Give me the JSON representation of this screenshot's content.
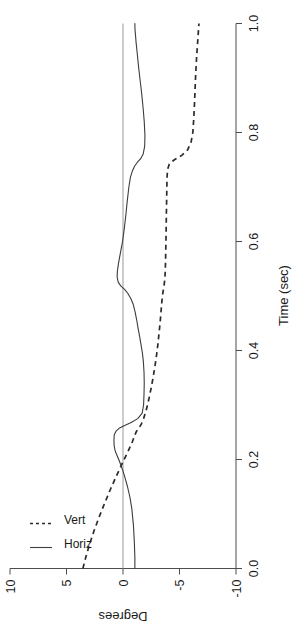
{
  "chart_data": {
    "type": "line",
    "title": "",
    "subtitle": "",
    "xlabel": "Time (sec)",
    "ylabel": "Degrees",
    "xlim": [
      0.0,
      1.0
    ],
    "ylim": [
      -10,
      10
    ],
    "grid": false,
    "orientation": "rotated-90-ccw",
    "legend_position": "top-left",
    "xticks": [
      "0.0",
      "0.2",
      "0.4",
      "0.6",
      "0.8",
      "1.0"
    ],
    "xtick_values": [
      0.0,
      0.2,
      0.4,
      0.6,
      0.8,
      1.0
    ],
    "yticks": [
      "10",
      "5",
      "0",
      "-5",
      "-10"
    ],
    "ytick_values": [
      10,
      5,
      0,
      -5,
      -10
    ],
    "zero_reference_line": 0,
    "series": [
      {
        "name": "Horiz",
        "style": "solid",
        "color": "#3c3c3c",
        "x": [
          0.0,
          0.02,
          0.05,
          0.08,
          0.11,
          0.13,
          0.15,
          0.165,
          0.18,
          0.195,
          0.205,
          0.212,
          0.218,
          0.225,
          0.235,
          0.245,
          0.252,
          0.258,
          0.262,
          0.268,
          0.275,
          0.285,
          0.3,
          0.32,
          0.34,
          0.36,
          0.38,
          0.395,
          0.41,
          0.425,
          0.44,
          0.455,
          0.47,
          0.485,
          0.495,
          0.505,
          0.512,
          0.518,
          0.525,
          0.535,
          0.545,
          0.56,
          0.58,
          0.6,
          0.625,
          0.65,
          0.675,
          0.7,
          0.718,
          0.73,
          0.738,
          0.745,
          0.752,
          0.76,
          0.775,
          0.795,
          0.82,
          0.845,
          0.87,
          0.895,
          0.92,
          0.945,
          0.965,
          0.98,
          0.99,
          1.0
        ],
        "values": [
          -1.05,
          -1.05,
          -1.0,
          -0.92,
          -0.78,
          -0.62,
          -0.4,
          -0.2,
          0.02,
          0.28,
          0.48,
          0.62,
          0.72,
          0.78,
          0.8,
          0.78,
          0.62,
          0.3,
          -0.1,
          -0.72,
          -1.3,
          -1.7,
          -1.82,
          -1.86,
          -1.88,
          -1.86,
          -1.8,
          -1.72,
          -1.6,
          -1.48,
          -1.34,
          -1.22,
          -1.08,
          -0.9,
          -0.7,
          -0.42,
          -0.14,
          0.18,
          0.42,
          0.52,
          0.5,
          0.4,
          0.22,
          0.04,
          -0.12,
          -0.26,
          -0.38,
          -0.52,
          -0.66,
          -0.84,
          -1.02,
          -1.26,
          -1.56,
          -1.78,
          -1.92,
          -1.94,
          -1.88,
          -1.78,
          -1.66,
          -1.52,
          -1.38,
          -1.26,
          -1.16,
          -1.1,
          -1.06,
          -1.05
        ]
      },
      {
        "name": "Vert",
        "style": "dashed",
        "color": "#2b2b2b",
        "x": [
          0.0,
          0.02,
          0.045,
          0.07,
          0.095,
          0.12,
          0.145,
          0.17,
          0.195,
          0.215,
          0.232,
          0.245,
          0.252,
          0.258,
          0.265,
          0.275,
          0.29,
          0.31,
          0.33,
          0.35,
          0.37,
          0.39,
          0.41,
          0.43,
          0.45,
          0.47,
          0.49,
          0.505,
          0.518,
          0.53,
          0.545,
          0.56,
          0.58,
          0.6,
          0.625,
          0.65,
          0.675,
          0.7,
          0.718,
          0.732,
          0.742,
          0.75,
          0.758,
          0.768,
          0.782,
          0.8,
          0.825,
          0.85,
          0.88,
          0.91,
          0.94,
          0.97,
          1.0
        ],
        "values": [
          3.55,
          3.3,
          2.95,
          2.55,
          2.1,
          1.62,
          1.12,
          0.58,
          0.02,
          -0.45,
          -0.82,
          -1.05,
          -1.2,
          -1.42,
          -1.62,
          -1.82,
          -2.05,
          -2.28,
          -2.48,
          -2.66,
          -2.82,
          -2.96,
          -3.08,
          -3.18,
          -3.28,
          -3.36,
          -3.44,
          -3.52,
          -3.62,
          -3.7,
          -3.74,
          -3.76,
          -3.78,
          -3.8,
          -3.82,
          -3.84,
          -3.86,
          -3.88,
          -3.9,
          -3.94,
          -4.1,
          -4.55,
          -5.2,
          -5.72,
          -6.02,
          -6.18,
          -6.26,
          -6.32,
          -6.38,
          -6.44,
          -6.52,
          -6.62,
          -6.72
        ]
      }
    ],
    "legend": [
      {
        "label": "Horiz",
        "style": "solid"
      },
      {
        "label": "Vert",
        "style": "dashed"
      }
    ]
  },
  "axes": {
    "x_title": "Time (sec)",
    "y_title": "Degrees"
  },
  "colors": {
    "background": "#ffffff",
    "axis": "#4d4d4d",
    "zero_line": "#9a9a9a",
    "horiz_series": "#3c3c3c",
    "vert_series": "#2b2b2b",
    "text": "#1a1a1a"
  }
}
